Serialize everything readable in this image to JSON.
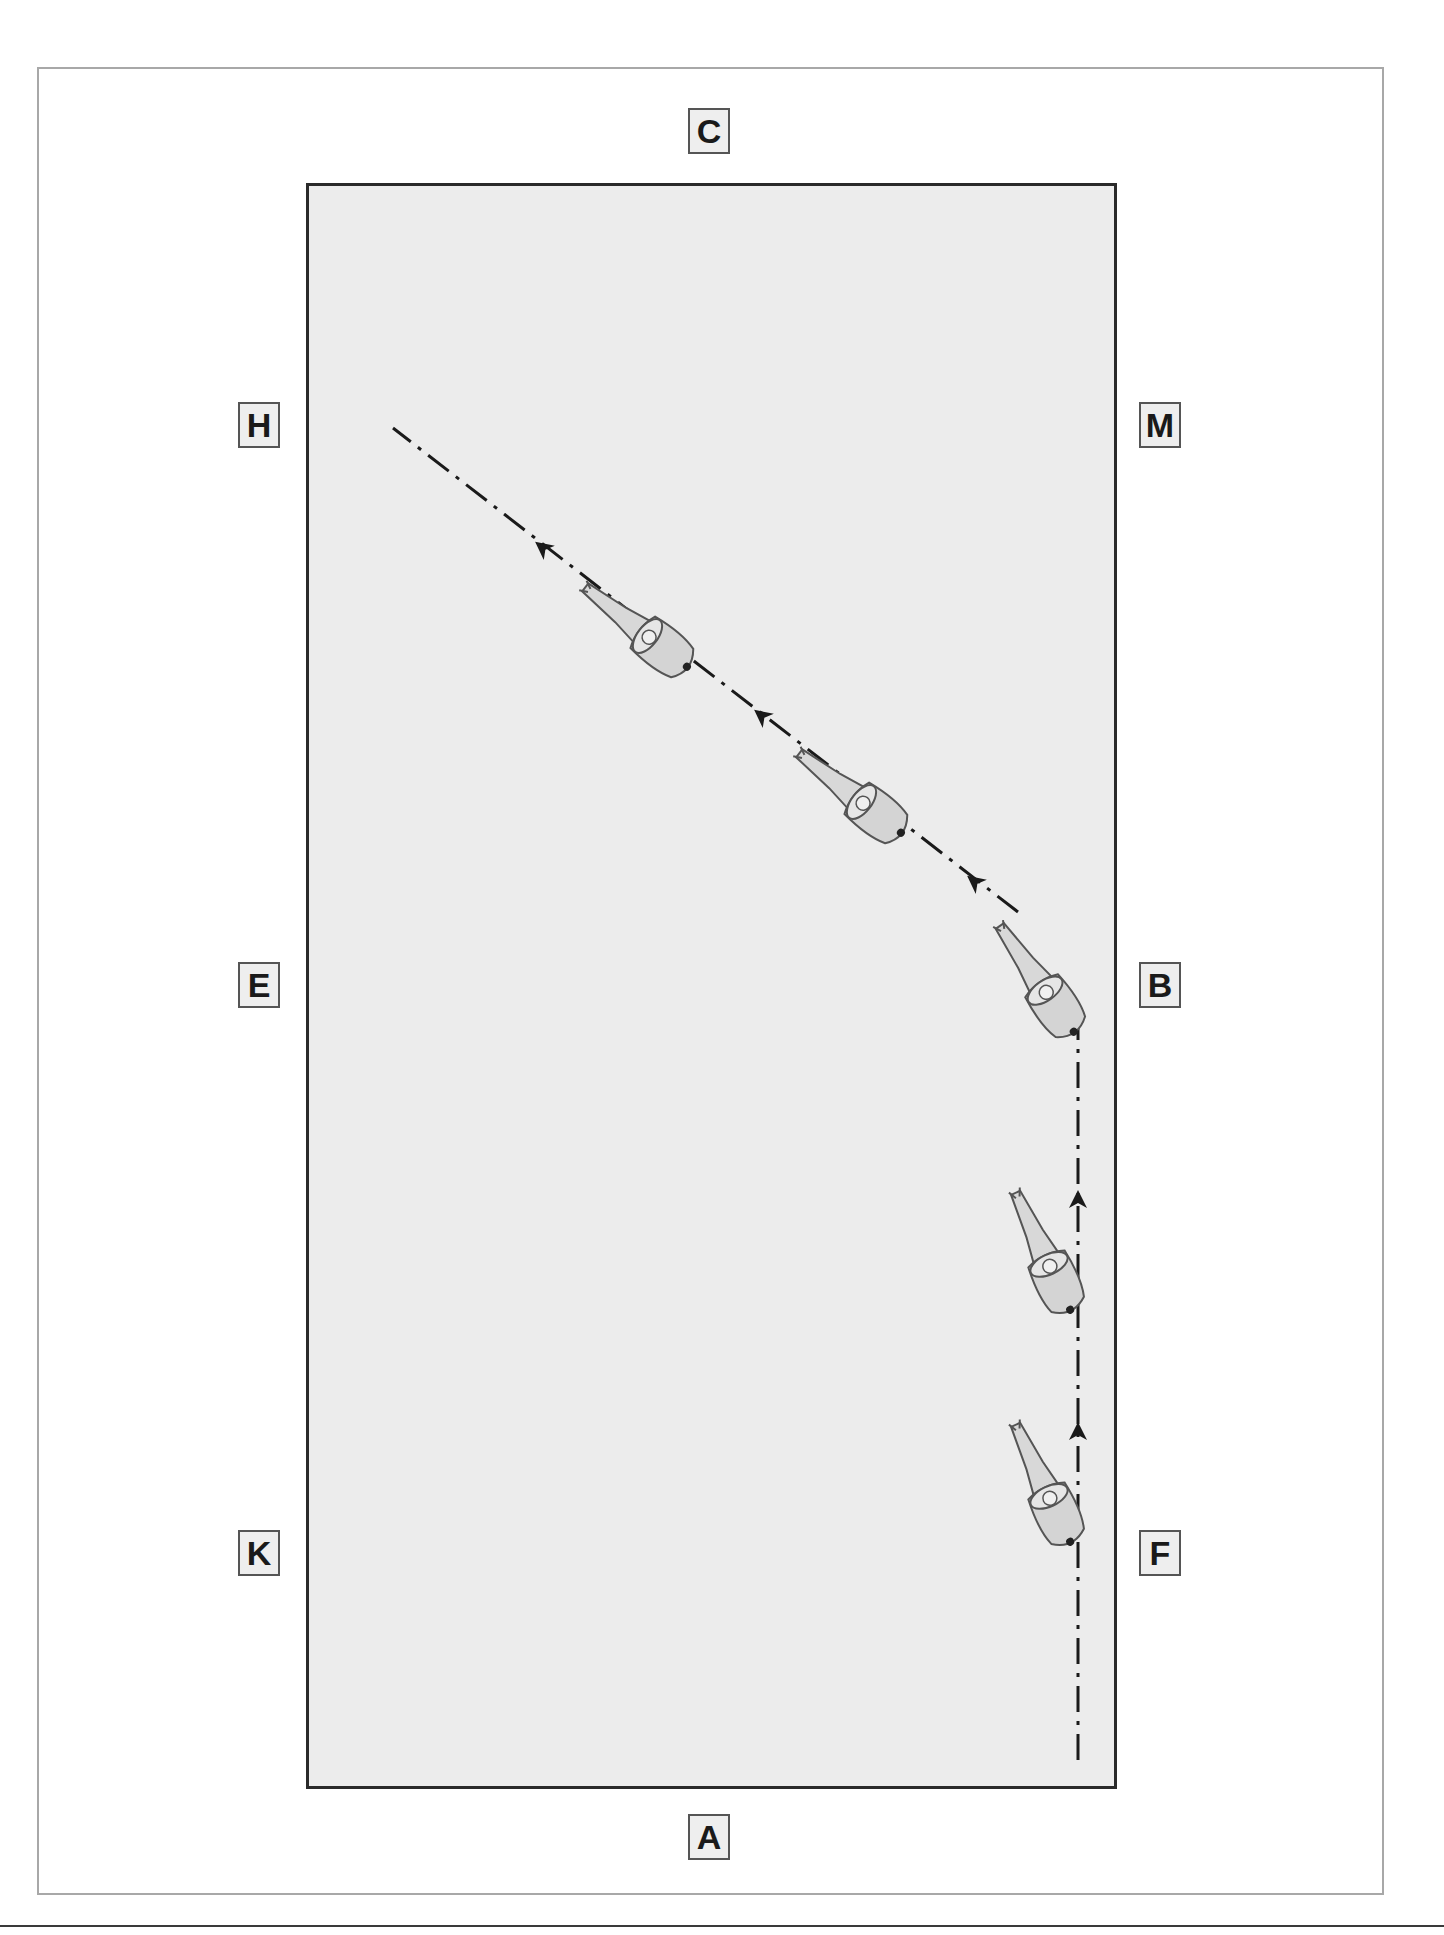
{
  "diagram": {
    "type": "dressage-arena-movement",
    "arena_fill": "#ececec",
    "arena_border": "#2a2a2a",
    "path_color": "#1a1a1a",
    "letters": {
      "top": "C",
      "bottom": "A",
      "left_upper": "H",
      "left_middle": "E",
      "left_lower": "K",
      "right_upper": "M",
      "right_middle": "B",
      "right_lower": "F"
    },
    "path": {
      "style": "dash-dot",
      "description": "Rider travels up the long side from A toward B, then leaves the track at B on a diagonal toward H",
      "segments": [
        {
          "from": "near A (right track)",
          "to": "B",
          "direction": "up"
        },
        {
          "from": "B",
          "to": "H",
          "direction": "up-left diagonal"
        }
      ],
      "direction_arrows": 5,
      "horse_figures": 5
    }
  }
}
